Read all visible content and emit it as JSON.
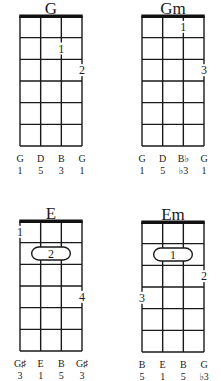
{
  "chords": [
    {
      "name": "G",
      "position": {
        "left": 20,
        "top": 0
      },
      "notes": [
        "G",
        "D",
        "B",
        "G"
      ],
      "intervals": [
        "1",
        "5",
        "3",
        "1"
      ],
      "fingers": [
        {
          "string": 3,
          "fret": 2,
          "label": "1",
          "type": "dot"
        },
        {
          "string": 4,
          "fret": 3,
          "label": "2",
          "type": "dot"
        }
      ]
    },
    {
      "name": "Gm",
      "position": {
        "left": 142,
        "top": 0
      },
      "notes": [
        "G",
        "D",
        "B♭",
        "G"
      ],
      "intervals": [
        "1",
        "5",
        "♭3",
        "1"
      ],
      "fingers": [
        {
          "string": 3,
          "fret": 1,
          "label": "1",
          "type": "dot"
        },
        {
          "string": 4,
          "fret": 3,
          "label": "3",
          "type": "dot"
        }
      ]
    },
    {
      "name": "E",
      "position": {
        "left": 20,
        "top": 205
      },
      "notes": [
        "G♯",
        "E",
        "B",
        "G♯"
      ],
      "intervals": [
        "3",
        "1",
        "5",
        "3"
      ],
      "fingers": [
        {
          "string": 1,
          "fret": 1,
          "label": "1",
          "type": "dot"
        },
        {
          "string": 2,
          "fret": 2,
          "label": "2",
          "type": "barre",
          "to_string": 3
        },
        {
          "string": 4,
          "fret": 4,
          "label": "4",
          "type": "dot"
        }
      ]
    },
    {
      "name": "Em",
      "position": {
        "left": 142,
        "top": 206
      },
      "notes": [
        "B",
        "E",
        "B",
        "G"
      ],
      "intervals": [
        "5",
        "1",
        "5",
        "♭3"
      ],
      "fingers": [
        {
          "string": 2,
          "fret": 2,
          "label": "1",
          "type": "barre",
          "to_string": 3
        },
        {
          "string": 4,
          "fret": 3,
          "label": "2",
          "type": "dot"
        },
        {
          "string": 1,
          "fret": 4,
          "label": "3",
          "type": "dot"
        }
      ]
    }
  ],
  "layout": {
    "strings": 4,
    "frets": 6,
    "grid_width": 62,
    "grid_height": 130,
    "line_color": "#1a1a1a",
    "nut_color": "#111111"
  }
}
